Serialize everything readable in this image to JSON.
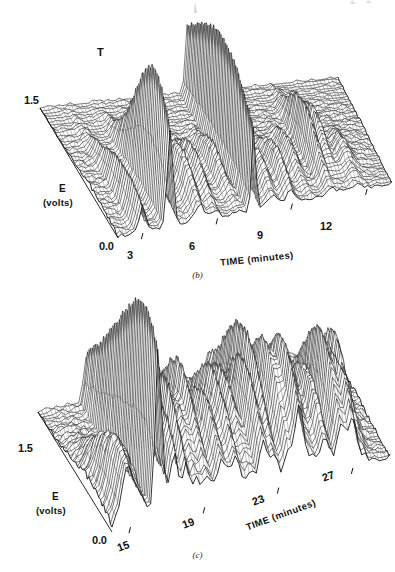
{
  "figure": {
    "background": "#ffffff",
    "ink": "#121212",
    "panels": [
      {
        "id": "b",
        "caption": "(b)",
        "annotations": [
          {
            "text": "T",
            "x": 97,
            "y": 46
          }
        ],
        "chart_data": {
          "type": "surface-3d-wireframe",
          "title": "",
          "xlabel": "TIME (minutes)",
          "ylabel": "E",
          "ylabel_unit": "(volts)",
          "ytick_labels": [
            "1.5",
            "0.0"
          ],
          "ylim": [
            0.0,
            1.5
          ],
          "xtick_labels": [
            "3",
            "6",
            "9",
            "12"
          ],
          "xtick_values": [
            3,
            6,
            9,
            12
          ],
          "xlim": [
            2,
            13
          ],
          "grid": true,
          "legend": "none",
          "mesh_rows": 46,
          "mesh_cols": 80,
          "description": "Stacked voltammogram surface; mostly flat baseline with a few sharp peaks, dominated by one very tall narrow spike near 6 minutes.",
          "peaks": [
            {
              "u": 0.09,
              "v": 0.8,
              "amp": 0.3,
              "wu": 0.012,
              "wv": 0.3
            },
            {
              "u": 0.19,
              "v": 0.86,
              "amp": 0.86,
              "wu": 0.01,
              "wv": 0.24
            },
            {
              "u": 0.19,
              "v": 0.62,
              "amp": 0.34,
              "wu": 0.013,
              "wv": 0.22
            },
            {
              "u": 0.3,
              "v": 0.74,
              "amp": 0.3,
              "wu": 0.016,
              "wv": 0.2
            },
            {
              "u": 0.355,
              "v": 0.7,
              "amp": 0.26,
              "wu": 0.014,
              "wv": 0.18
            },
            {
              "u": 0.44,
              "v": 0.62,
              "amp": 0.22,
              "wu": 0.013,
              "wv": 0.17
            },
            {
              "u": 0.495,
              "v": 0.55,
              "amp": 1.0,
              "wu": 0.0075,
              "wv": 0.52
            },
            {
              "u": 0.565,
              "v": 0.78,
              "amp": 0.2,
              "wu": 0.016,
              "wv": 0.16
            },
            {
              "u": 0.63,
              "v": 0.8,
              "amp": 0.24,
              "wu": 0.015,
              "wv": 0.18
            },
            {
              "u": 0.7,
              "v": 0.66,
              "amp": 0.2,
              "wu": 0.014,
              "wv": 0.16
            },
            {
              "u": 0.775,
              "v": 0.56,
              "amp": 0.4,
              "wu": 0.012,
              "wv": 0.22
            },
            {
              "u": 0.815,
              "v": 0.52,
              "amp": 0.3,
              "wu": 0.012,
              "wv": 0.18
            },
            {
              "u": 0.875,
              "v": 0.74,
              "amp": 0.14,
              "wu": 0.018,
              "wv": 0.16
            },
            {
              "u": 0.26,
              "v": 0.4,
              "amp": 0.13,
              "wu": 0.015,
              "wv": 0.16
            }
          ],
          "ridge_amp": 0.055,
          "noise_amp": 0.018
        },
        "geometry": {
          "front_left": [
            118,
            238
          ],
          "front_right": [
            392,
            184
          ],
          "back_left": [
            40,
            108
          ],
          "back_right": [
            338,
            78
          ],
          "z_height": 120
        }
      },
      {
        "id": "c",
        "caption": "(c)",
        "annotations": [],
        "chart_data": {
          "type": "surface-3d-wireframe",
          "title": "",
          "xlabel": "TIME (minutes)",
          "ylabel": "E",
          "ylabel_unit": "(volts)",
          "ytick_labels": [
            "1.5",
            "0.0"
          ],
          "ylim": [
            0.0,
            1.5
          ],
          "xtick_labels": [
            "15",
            "19",
            "23",
            "27"
          ],
          "xtick_values": [
            15,
            19,
            23,
            27
          ],
          "xlim": [
            14,
            29
          ],
          "grid": true,
          "legend": "none",
          "mesh_rows": 46,
          "mesh_cols": 80,
          "description": "Stacked voltammogram surface with many large overlapping peaks across the whole window; tallest sharp spike near 17 minutes and a broad cluster of tall peaks between 22 and 27 minutes.",
          "peaks": [
            {
              "u": 0.055,
              "v": 0.88,
              "amp": 0.42,
              "wu": 0.022,
              "wv": 0.26
            },
            {
              "u": 0.1,
              "v": 0.78,
              "amp": 0.3,
              "wu": 0.02,
              "wv": 0.22
            },
            {
              "u": 0.165,
              "v": 0.7,
              "amp": 1.0,
              "wu": 0.01,
              "wv": 0.46
            },
            {
              "u": 0.175,
              "v": 0.9,
              "amp": 0.4,
              "wu": 0.016,
              "wv": 0.22
            },
            {
              "u": 0.225,
              "v": 0.8,
              "amp": 0.52,
              "wu": 0.013,
              "wv": 0.26
            },
            {
              "u": 0.265,
              "v": 0.66,
              "amp": 0.56,
              "wu": 0.012,
              "wv": 0.28
            },
            {
              "u": 0.305,
              "v": 0.72,
              "amp": 0.4,
              "wu": 0.016,
              "wv": 0.22
            },
            {
              "u": 0.345,
              "v": 0.6,
              "amp": 0.58,
              "wu": 0.014,
              "wv": 0.26
            },
            {
              "u": 0.395,
              "v": 0.74,
              "amp": 0.52,
              "wu": 0.018,
              "wv": 0.24
            },
            {
              "u": 0.445,
              "v": 0.66,
              "amp": 0.6,
              "wu": 0.017,
              "wv": 0.26
            },
            {
              "u": 0.495,
              "v": 0.58,
              "amp": 0.5,
              "wu": 0.016,
              "wv": 0.24
            },
            {
              "u": 0.545,
              "v": 0.7,
              "amp": 0.56,
              "wu": 0.015,
              "wv": 0.26
            },
            {
              "u": 0.585,
              "v": 0.52,
              "amp": 0.66,
              "wu": 0.013,
              "wv": 0.3
            },
            {
              "u": 0.635,
              "v": 0.64,
              "amp": 0.62,
              "wu": 0.016,
              "wv": 0.26
            },
            {
              "u": 0.675,
              "v": 0.78,
              "amp": 0.72,
              "wu": 0.015,
              "wv": 0.26
            },
            {
              "u": 0.715,
              "v": 0.6,
              "amp": 0.58,
              "wu": 0.016,
              "wv": 0.24
            },
            {
              "u": 0.765,
              "v": 0.7,
              "amp": 0.5,
              "wu": 0.017,
              "wv": 0.24
            },
            {
              "u": 0.825,
              "v": 0.66,
              "amp": 0.64,
              "wu": 0.014,
              "wv": 0.26
            },
            {
              "u": 0.865,
              "v": 0.72,
              "amp": 0.6,
              "wu": 0.014,
              "wv": 0.24
            },
            {
              "u": 0.905,
              "v": 0.6,
              "amp": 0.34,
              "wu": 0.016,
              "wv": 0.2
            }
          ],
          "ridge_amp": 0.1,
          "noise_amp": 0.022
        },
        "geometry": {
          "front_left": [
            112,
            246
          ],
          "front_right": [
            390,
            172
          ],
          "back_left": [
            38,
            126
          ],
          "back_right": [
            330,
            62
          ],
          "z_height": 150
        }
      }
    ]
  }
}
